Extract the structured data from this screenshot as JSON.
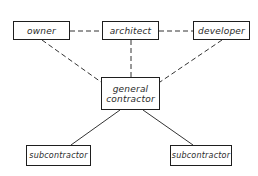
{
  "diagram": {
    "type": "organization-relationship",
    "nodes": [
      {
        "id": "owner",
        "label": "owner"
      },
      {
        "id": "architect",
        "label": "architect"
      },
      {
        "id": "developer",
        "label": "developer"
      },
      {
        "id": "general_contractor",
        "label_line1": "general",
        "label_line2": "contractor"
      },
      {
        "id": "subcontractor_1",
        "label": "subcontractor"
      },
      {
        "id": "subcontractor_2",
        "label": "subcontractor"
      }
    ],
    "edges": [
      {
        "from": "owner",
        "to": "architect",
        "style": "dashed"
      },
      {
        "from": "architect",
        "to": "developer",
        "style": "dashed"
      },
      {
        "from": "owner",
        "to": "general_contractor",
        "style": "dashed"
      },
      {
        "from": "architect",
        "to": "general_contractor",
        "style": "dashed"
      },
      {
        "from": "developer",
        "to": "general_contractor",
        "style": "dashed"
      },
      {
        "from": "general_contractor",
        "to": "subcontractor_1",
        "style": "solid"
      },
      {
        "from": "general_contractor",
        "to": "subcontractor_2",
        "style": "solid"
      }
    ],
    "colors": {
      "line": "#1e1e1e",
      "text": "#2a2a2a",
      "background": "#ffffff"
    }
  }
}
